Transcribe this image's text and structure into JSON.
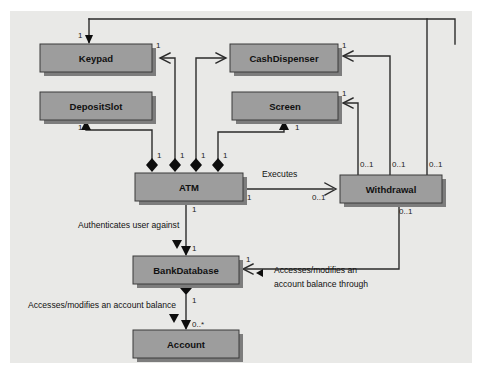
{
  "diagram": {
    "kind": "uml-class-diagram",
    "colors": {
      "page_background": "#ffffff",
      "panel_background": "#e9e9e7",
      "class_fill": "#9d9d9d",
      "class_border": "#3a3a3a",
      "class_shadow": "#7d7d7d",
      "line": "#2b2b2b",
      "text": "#111111"
    },
    "classes": [
      {
        "id": "keypad",
        "name": "Keypad",
        "x": 40,
        "y": 44,
        "w": 112,
        "h": 28
      },
      {
        "id": "cashdispenser",
        "name": "CashDispenser",
        "x": 230,
        "y": 44,
        "w": 108,
        "h": 28
      },
      {
        "id": "depositslot",
        "name": "DepositSlot",
        "x": 40,
        "y": 92,
        "w": 112,
        "h": 28
      },
      {
        "id": "screen",
        "name": "Screen",
        "x": 232,
        "y": 92,
        "w": 106,
        "h": 28
      },
      {
        "id": "atm",
        "name": "ATM",
        "x": 135,
        "y": 173,
        "w": 108,
        "h": 28
      },
      {
        "id": "withdrawal",
        "name": "Withdrawal",
        "x": 340,
        "y": 175,
        "w": 102,
        "h": 28
      },
      {
        "id": "bankdatabase",
        "name": "BankDatabase",
        "x": 133,
        "y": 256,
        "w": 106,
        "h": 28
      },
      {
        "id": "account",
        "name": "Account",
        "x": 133,
        "y": 330,
        "w": 106,
        "h": 28
      }
    ],
    "association_labels": [
      {
        "id": "executes",
        "text": "Executes",
        "x": 262,
        "y": 177
      },
      {
        "id": "authenticates",
        "text": "Authenticates user against",
        "x": 78,
        "y": 228
      },
      {
        "id": "accesses-balance",
        "text": "Accesses/modifies an account balance",
        "x": 28,
        "y": 308
      },
      {
        "id": "accesses-through-1",
        "text": "Accesses/modifies an",
        "x": 274,
        "y": 273
      },
      {
        "id": "accesses-through-2",
        "text": "account balance through",
        "x": 274,
        "y": 287
      }
    ],
    "multiplicities": [
      {
        "id": "m-keypad-top",
        "text": "1",
        "x": 78,
        "y": 38
      },
      {
        "id": "m-keypad-right",
        "text": "1",
        "x": 156,
        "y": 48
      },
      {
        "id": "m-cashdisp-right",
        "text": "1",
        "x": 342,
        "y": 48
      },
      {
        "id": "m-depositslot-bot",
        "text": "1",
        "x": 78,
        "y": 130
      },
      {
        "id": "m-screen-right",
        "text": "1",
        "x": 342,
        "y": 96
      },
      {
        "id": "m-screen-bot",
        "text": "1",
        "x": 225,
        "y": 130
      },
      {
        "id": "m-atm-d1",
        "text": "1",
        "x": 157,
        "y": 158
      },
      {
        "id": "m-atm-d2",
        "text": "1",
        "x": 180,
        "y": 158
      },
      {
        "id": "m-atm-d3",
        "text": "1",
        "x": 201,
        "y": 158
      },
      {
        "id": "m-atm-d4",
        "text": "1",
        "x": 223,
        "y": 158
      },
      {
        "id": "m-atm-right",
        "text": "1",
        "x": 247,
        "y": 200
      },
      {
        "id": "m-withdrawal-left",
        "text": "0..1",
        "x": 312,
        "y": 200
      },
      {
        "id": "m-wd-top-1",
        "text": "0..1",
        "x": 360,
        "y": 167
      },
      {
        "id": "m-wd-top-2",
        "text": "0..1",
        "x": 392,
        "y": 167
      },
      {
        "id": "m-wd-top-3",
        "text": "0..1",
        "x": 429,
        "y": 167
      },
      {
        "id": "m-wd-bottom",
        "text": "0..1",
        "x": 399,
        "y": 214
      },
      {
        "id": "m-atm-bankdb-top",
        "text": "1",
        "x": 197,
        "y": 212
      },
      {
        "id": "m-bankdb-top",
        "text": "1",
        "x": 197,
        "y": 251
      },
      {
        "id": "m-bankdb-right",
        "text": "1",
        "x": 246,
        "y": 262
      },
      {
        "id": "m-bankdb-bot",
        "text": "1",
        "x": 197,
        "y": 303
      },
      {
        "id": "m-account-top",
        "text": "0..*",
        "x": 197,
        "y": 325
      }
    ]
  }
}
